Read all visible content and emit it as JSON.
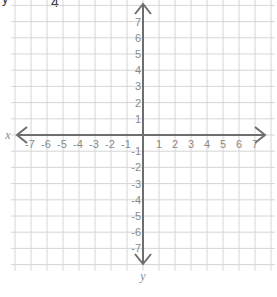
{
  "header_fragment": {
    "text": "4",
    "partial_text_left": "y"
  },
  "grid": {
    "x_min": -7,
    "x_max": 7,
    "y_min": -7,
    "y_max": 7,
    "extra_cells": 1,
    "grid_color": "#d6d6d6",
    "axis_color": "#6e6e6e",
    "label_color": "#8a8a8a"
  },
  "axes": {
    "x_label": "x",
    "y_label": "y",
    "x_ticks": [
      "-7",
      "-6",
      "-5",
      "-4",
      "-3",
      "-2",
      "-1",
      "1",
      "2",
      "3",
      "4",
      "5",
      "6",
      "7"
    ],
    "y_ticks": [
      "7",
      "6",
      "5",
      "4",
      "3",
      "2",
      "1",
      "-1",
      "-2",
      "-3",
      "-4",
      "-5",
      "-6",
      "-7"
    ]
  },
  "chart_data": {
    "type": "coordinate-plane",
    "title": "",
    "xlabel": "x",
    "ylabel": "y",
    "xlim": [
      -7,
      7
    ],
    "ylim": [
      -7,
      7
    ],
    "grid": true,
    "x_tick_labels": [
      -7,
      -6,
      -5,
      -4,
      -3,
      -2,
      -1,
      1,
      2,
      3,
      4,
      5,
      6,
      7
    ],
    "y_tick_labels": [
      7,
      6,
      5,
      4,
      3,
      2,
      1,
      -1,
      -2,
      -3,
      -4,
      -5,
      -6,
      -7
    ],
    "series": []
  }
}
